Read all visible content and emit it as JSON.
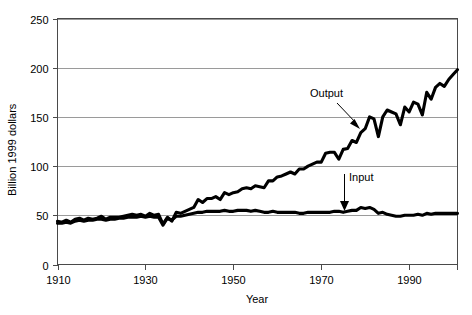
{
  "chart_data": {
    "type": "line",
    "title": "",
    "xlabel": "Year",
    "ylabel": "Billion 1999 dollars",
    "xlim": [
      1910,
      2001
    ],
    "ylim": [
      0,
      250
    ],
    "grid": true,
    "gridlines_y": [
      50,
      100,
      150,
      200,
      250
    ],
    "legend_position": "inline-annotation",
    "xticks": [
      1910,
      1930,
      1950,
      1970,
      1990
    ],
    "xtick_labels": [
      "1910",
      "1930",
      "1950",
      "1970",
      "1990"
    ],
    "yticks": [
      0,
      50,
      100,
      150,
      200,
      250
    ],
    "ytick_labels": [
      "0",
      "50",
      "100",
      "150",
      "200",
      "250"
    ],
    "annotations": [
      {
        "text": "Output",
        "target_series": "Output",
        "arrow": "diagonal-down-right"
      },
      {
        "text": "Input",
        "target_series": "Input",
        "arrow": "vertical-down"
      }
    ],
    "x": [
      1910,
      1911,
      1912,
      1913,
      1914,
      1915,
      1916,
      1917,
      1918,
      1919,
      1920,
      1921,
      1922,
      1923,
      1924,
      1925,
      1926,
      1927,
      1928,
      1929,
      1930,
      1931,
      1932,
      1933,
      1934,
      1935,
      1936,
      1937,
      1938,
      1939,
      1940,
      1941,
      1942,
      1943,
      1944,
      1945,
      1946,
      1947,
      1948,
      1949,
      1950,
      1951,
      1952,
      1953,
      1954,
      1955,
      1956,
      1957,
      1958,
      1959,
      1960,
      1961,
      1962,
      1963,
      1964,
      1965,
      1966,
      1967,
      1968,
      1969,
      1970,
      1971,
      1972,
      1973,
      1974,
      1975,
      1976,
      1977,
      1978,
      1979,
      1980,
      1981,
      1982,
      1983,
      1984,
      1985,
      1986,
      1987,
      1988,
      1989,
      1990,
      1991,
      1992,
      1993,
      1994,
      1995,
      1996,
      1997,
      1998,
      1999,
      2000,
      2001
    ],
    "series": [
      {
        "name": "Output",
        "color": "#000000",
        "values": [
          44,
          43,
          45,
          43,
          46,
          47,
          45,
          47,
          46,
          47,
          49,
          46,
          48,
          48,
          48,
          49,
          50,
          51,
          50,
          51,
          49,
          52,
          50,
          51,
          41,
          48,
          44,
          53,
          52,
          54,
          56,
          58,
          66,
          63,
          67,
          67,
          69,
          66,
          73,
          71,
          73,
          74,
          77,
          78,
          77,
          80,
          79,
          78,
          85,
          85,
          89,
          90,
          92,
          94,
          92,
          97,
          97,
          100,
          102,
          104,
          104,
          113,
          114,
          114,
          107,
          117,
          118,
          126,
          124,
          134,
          138,
          150,
          148,
          130,
          150,
          157,
          155,
          153,
          142,
          160,
          155,
          165,
          163,
          152,
          175,
          168,
          180,
          184,
          181,
          188,
          193,
          198
        ]
      },
      {
        "name": "Input",
        "color": "#000000",
        "values": [
          42,
          42,
          43,
          42,
          44,
          45,
          44,
          45,
          45,
          46,
          46,
          45,
          46,
          46,
          47,
          47,
          48,
          48,
          48,
          49,
          48,
          49,
          48,
          48,
          40,
          47,
          45,
          49,
          49,
          50,
          51,
          52,
          53,
          53,
          54,
          54,
          54,
          54,
          55,
          54,
          54,
          55,
          55,
          55,
          54,
          55,
          54,
          53,
          53,
          54,
          53,
          53,
          53,
          53,
          53,
          52,
          52,
          53,
          53,
          53,
          53,
          53,
          53,
          54,
          54,
          53,
          54,
          55,
          55,
          58,
          57,
          58,
          56,
          52,
          53,
          51,
          50,
          49,
          49,
          50,
          50,
          50,
          51,
          50,
          52,
          51,
          52,
          52,
          52,
          52,
          52,
          52
        ]
      }
    ]
  },
  "axes": {
    "y_title": "Billion 1999 dollars",
    "x_title": "Year"
  }
}
